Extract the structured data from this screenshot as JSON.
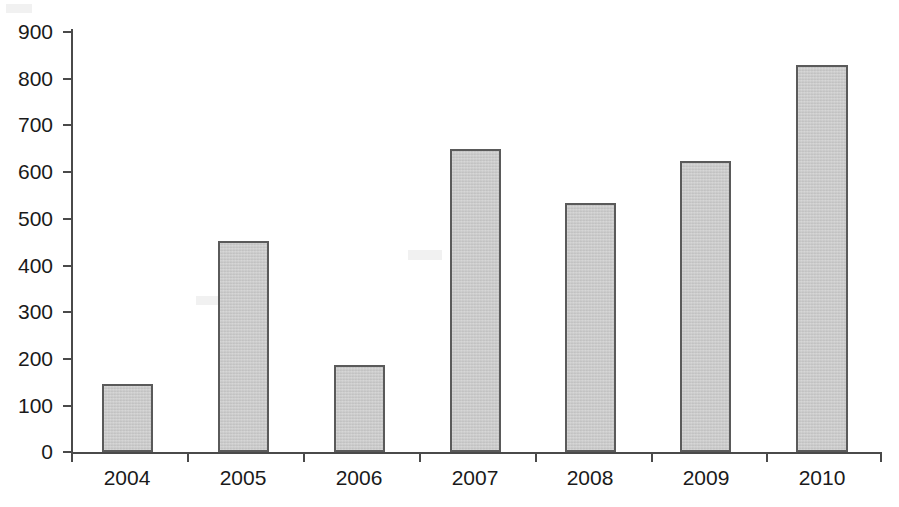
{
  "chart_data": {
    "type": "bar",
    "title": "",
    "subtitle": "",
    "xlabel": "",
    "ylabel": "",
    "categories": [
      "2004",
      "2005",
      "2006",
      "2007",
      "2008",
      "2009",
      "2010"
    ],
    "values": [
      145,
      450,
      185,
      647,
      533,
      623,
      828
    ],
    "series": [
      {
        "name": "",
        "values": [
          145,
          450,
          185,
          647,
          533,
          623,
          828
        ]
      }
    ],
    "ylim": [
      0,
      900
    ],
    "y_ticks": [
      0,
      100,
      200,
      300,
      400,
      500,
      600,
      700,
      800,
      900
    ],
    "y_tick_labels": [
      "0",
      "100",
      "200",
      "300",
      "400",
      "500",
      "600",
      "700",
      "800",
      "900"
    ],
    "x_tick_labels": [
      "2004",
      "2005",
      "2006",
      "2007",
      "2008",
      "2009",
      "2010"
    ],
    "grid": false,
    "legend": false,
    "legend_position": "none",
    "annotations": [],
    "colors": {
      "bar_fill": "#c9c9c9",
      "bar_border": "#5a5a5a",
      "axis": "#4a4a4a",
      "text": "#1a1a1a",
      "background": "#ffffff"
    }
  }
}
